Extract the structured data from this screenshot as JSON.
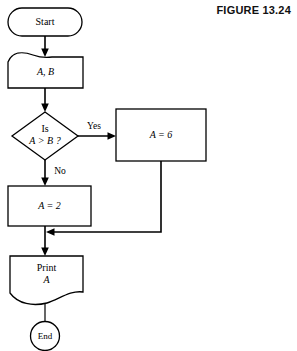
{
  "figure": {
    "label": "FIGURE 13.24",
    "caption_visible": false
  },
  "flowchart": {
    "title": "FIGURE 13.24",
    "nodes": {
      "start": {
        "id": "start",
        "shape": "terminator",
        "text": "Start"
      },
      "input": {
        "id": "input",
        "shape": "document",
        "text": "A, B"
      },
      "decision": {
        "id": "decision",
        "shape": "diamond",
        "line1": "Is",
        "line2": "A > B ?"
      },
      "assign_true": {
        "id": "assign_true",
        "shape": "process",
        "text": "A = 6"
      },
      "assign_false": {
        "id": "assign_false",
        "shape": "process",
        "text": "A = 2"
      },
      "print": {
        "id": "print",
        "shape": "document",
        "line1": "Print",
        "line2": "A"
      },
      "end": {
        "id": "end",
        "shape": "circle",
        "text": "End"
      }
    },
    "edges": [
      {
        "id": "start-to-input",
        "from": "start",
        "to": "input",
        "label": ""
      },
      {
        "id": "input-to-decision",
        "from": "input",
        "to": "decision",
        "label": ""
      },
      {
        "id": "decision-yes",
        "from": "decision",
        "to": "assign_true",
        "label": "Yes"
      },
      {
        "id": "decision-no",
        "from": "decision",
        "to": "assign_false",
        "label": "No"
      },
      {
        "id": "assign-true-to-merge",
        "from": "assign_true",
        "to": "merge",
        "label": ""
      },
      {
        "id": "assign-false-to-print",
        "from": "assign_false",
        "to": "print",
        "label": ""
      },
      {
        "id": "print-to-end",
        "from": "print",
        "to": "end",
        "label": ""
      }
    ],
    "edge_labels": {
      "yes": "Yes",
      "no": "No"
    },
    "colors": {
      "stroke": "#000000",
      "fill": "#ffffff",
      "background": "#ffffff",
      "text": "#000000"
    }
  }
}
